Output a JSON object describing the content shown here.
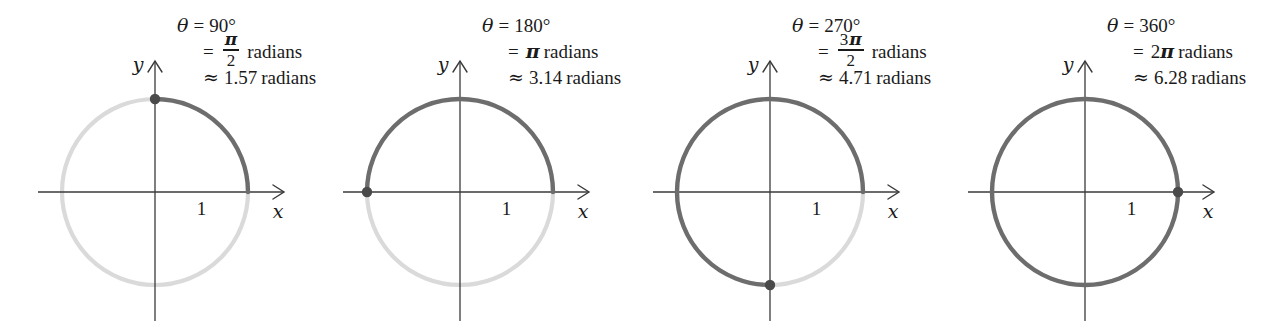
{
  "figure": {
    "colors": {
      "arc_traced": "#6d6d6d",
      "arc_untraced": "#dadada",
      "axis": "#3a3a3a",
      "dot": "#4a4a4a",
      "text": "#1a1a1a",
      "background": "#ffffff"
    },
    "symbols": {
      "theta": "θ",
      "equals": "=",
      "approx": "≈",
      "pi": "π",
      "degree": "°"
    },
    "common": {
      "radians_word": "radians",
      "radius_label": "1",
      "x_axis_label": "x",
      "y_axis_label": "y"
    },
    "panels": [
      {
        "id": "panel-90",
        "degrees": "90",
        "degrees_text": "90°",
        "radians_exact_numerator": "π",
        "radians_exact_denominator": "2",
        "radians_is_fraction": true,
        "radians_fraction_coefficient": "",
        "radians_approx": "1.57",
        "terminal_angle_deg": 90,
        "traced_sweep_deg": 90,
        "dot_position": "top",
        "dot_point": [
          0,
          1
        ]
      },
      {
        "id": "panel-180",
        "degrees": "180",
        "degrees_text": "180°",
        "radians_exact_numerator": "π",
        "radians_exact_denominator": "",
        "radians_is_fraction": false,
        "radians_fraction_coefficient": "",
        "radians_approx": "3.14",
        "terminal_angle_deg": 180,
        "traced_sweep_deg": 180,
        "dot_position": "left",
        "dot_point": [
          -1,
          0
        ]
      },
      {
        "id": "panel-270",
        "degrees": "270",
        "degrees_text": "270°",
        "radians_exact_numerator": "3π",
        "radians_exact_denominator": "2",
        "radians_is_fraction": true,
        "radians_fraction_coefficient": "3",
        "radians_approx": "4.71",
        "terminal_angle_deg": 270,
        "traced_sweep_deg": 270,
        "dot_position": "bottom",
        "dot_point": [
          0,
          -1
        ]
      },
      {
        "id": "panel-360",
        "degrees": "360",
        "degrees_text": "360°",
        "radians_exact_numerator": "2π",
        "radians_exact_denominator": "",
        "radians_is_fraction": false,
        "radians_fraction_coefficient": "2",
        "radians_approx": "6.28",
        "terminal_angle_deg": 360,
        "traced_sweep_deg": 360,
        "dot_position": "right",
        "dot_point": [
          1,
          0
        ]
      }
    ]
  }
}
